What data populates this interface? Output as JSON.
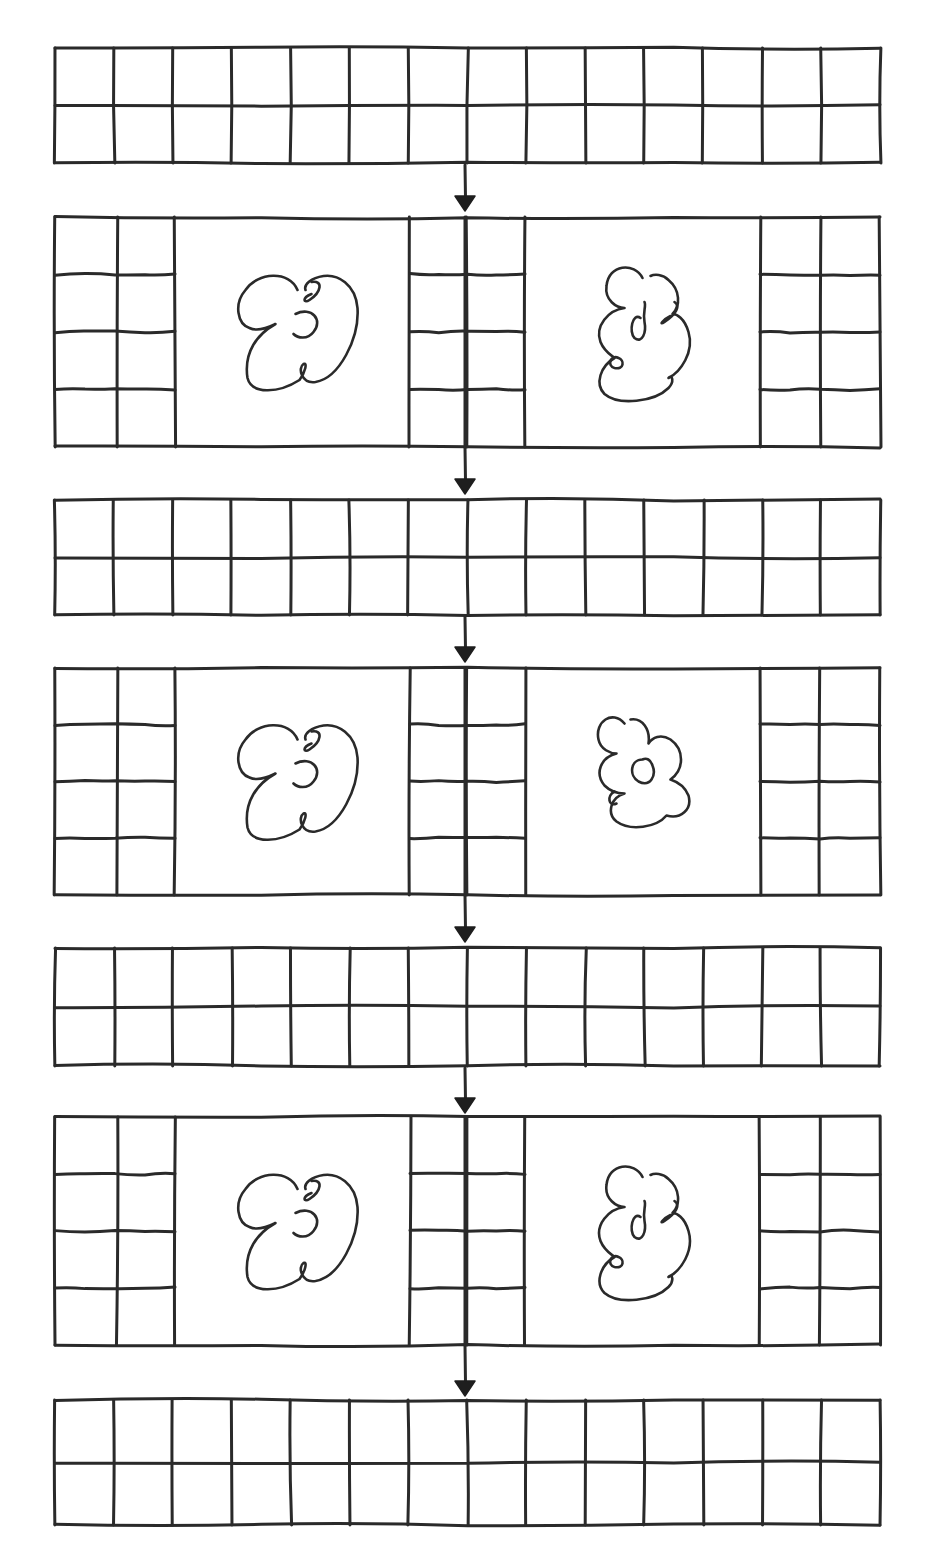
{
  "diagram": {
    "title": "",
    "ink_color": "#2a2a2a",
    "background": "#ffffff",
    "outer_left": 55,
    "outer_right": 880,
    "center_x": 465,
    "bands": [
      {
        "id": "band-1",
        "kind": "grid",
        "top": 48,
        "bottom": 163,
        "cols": 14,
        "rows": 2
      },
      {
        "id": "band-2",
        "kind": "panel",
        "top": 217,
        "bottom": 447,
        "side_rows": 4,
        "panels": [
          "cloud-a",
          "cloud-b"
        ]
      },
      {
        "id": "band-3",
        "kind": "grid",
        "top": 500,
        "bottom": 615,
        "cols": 14,
        "rows": 2
      },
      {
        "id": "band-4",
        "kind": "panel",
        "top": 668,
        "bottom": 895,
        "side_rows": 4,
        "panels": [
          "cloud-a",
          "cloud-c"
        ]
      },
      {
        "id": "band-5",
        "kind": "grid",
        "top": 948,
        "bottom": 1066,
        "cols": 14,
        "rows": 2
      },
      {
        "id": "band-6",
        "kind": "panel",
        "top": 1117,
        "bottom": 1345,
        "side_rows": 4,
        "panels": [
          "cloud-a",
          "cloud-b"
        ]
      },
      {
        "id": "band-7",
        "kind": "grid",
        "top": 1400,
        "bottom": 1525,
        "cols": 14,
        "rows": 2
      }
    ],
    "panel_layout": {
      "left_grid": [
        55,
        117,
        175
      ],
      "left_panel": [
        175,
        410
      ],
      "center_grid": [
        410,
        467,
        525
      ],
      "right_panel": [
        525,
        760
      ],
      "right_grid": [
        760,
        820,
        880
      ]
    },
    "arrows": [
      {
        "from": "band-1",
        "to": "band-2",
        "y1": 165,
        "y2": 210
      },
      {
        "from": "band-2",
        "to": "band-3",
        "y1": 447,
        "y2": 493
      },
      {
        "from": "band-3",
        "to": "band-4",
        "y1": 617,
        "y2": 661
      },
      {
        "from": "band-4",
        "to": "band-5",
        "y1": 895,
        "y2": 941
      },
      {
        "from": "band-5",
        "to": "band-6",
        "y1": 1068,
        "y2": 1112
      },
      {
        "from": "band-6",
        "to": "band-7",
        "y1": 1345,
        "y2": 1395
      }
    ],
    "icons": {
      "arrow": "arrow-down-icon",
      "cloud": "scribble-cloud-icon"
    }
  }
}
